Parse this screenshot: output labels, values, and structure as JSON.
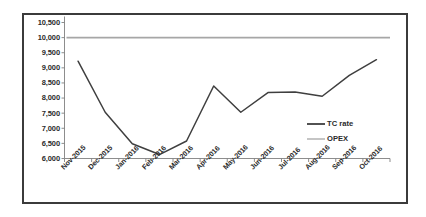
{
  "chart_data": {
    "type": "line",
    "title": "",
    "subtitle": "",
    "xlabel": "",
    "ylabel": "",
    "categories": [
      "Nov-2015",
      "Dec-2015",
      "Jan-2016",
      "Feb-2016",
      "Mar-2016",
      "Apr-2016",
      "May-2016",
      "Jun-2016",
      "Jul-2016",
      "Aug-2016",
      "Sep-2016",
      "Oct-2016"
    ],
    "series": [
      {
        "name": "TC rate",
        "color": "#3f3f3f",
        "values": [
          9220,
          7530,
          6490,
          6130,
          6580,
          8400,
          7530,
          8180,
          8200,
          8060,
          8750,
          9270
        ]
      },
      {
        "name": "OPEX",
        "color": "#a6a6a6",
        "values": [
          10000,
          10000,
          10000,
          10000,
          10000,
          10000,
          10000,
          10000,
          10000,
          10000,
          10000,
          10000
        ]
      }
    ],
    "ylim": [
      6000,
      10500
    ],
    "ytick_values": [
      6000,
      6500,
      7000,
      7500,
      8000,
      8500,
      9000,
      9500,
      10000,
      10500
    ],
    "ytick_labels": [
      "6,000",
      "6,500",
      "7,000",
      "7,500",
      "8,000",
      "8,500",
      "9,000",
      "9,500",
      "10,000",
      "10,500"
    ],
    "grid": false,
    "legend_position": "inside-right"
  },
  "legend": {
    "entries": [
      {
        "label": "TC rate",
        "color": "#3f3f3f"
      },
      {
        "label": "OPEX",
        "color": "#a6a6a6"
      }
    ]
  },
  "axes": {
    "y_axis_name": "value-axis",
    "x_axis_name": "category-axis"
  },
  "colors": {
    "frame": "#3b3b3b",
    "axis": "#808080",
    "tc_rate": "#3f3f3f",
    "opex": "#a6a6a6",
    "text": "#2b2b2b",
    "background": "#ffffff"
  }
}
